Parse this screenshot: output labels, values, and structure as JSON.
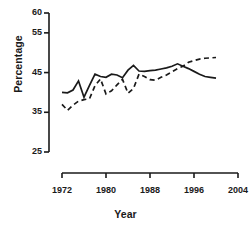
{
  "chart_data": {
    "type": "line",
    "title": "",
    "xlabel": "Year",
    "ylabel": "Percentage",
    "xlim": [
      1972,
      2004
    ],
    "ylim": [
      25,
      60
    ],
    "grid": false,
    "legend": "none",
    "xticks": [
      1972,
      1980,
      1988,
      1996,
      2004
    ],
    "yticks": [
      25,
      35,
      45,
      55,
      60
    ],
    "x": [
      1972,
      1973,
      1974,
      1975,
      1976,
      1977,
      1978,
      1979,
      1980,
      1981,
      1982,
      1983,
      1984,
      1985,
      1986,
      1987,
      1988,
      1989,
      1990,
      1991,
      1992,
      1993,
      1994,
      1995,
      1996,
      1997,
      1998,
      1999,
      2000
    ],
    "series": [
      {
        "name": "solid-series",
        "style": "solid",
        "color": "#1a1a1a",
        "values": [
          40.0,
          39.9,
          40.6,
          42.9,
          38.8,
          41.8,
          44.6,
          44.0,
          43.8,
          44.6,
          44.4,
          43.7,
          45.6,
          46.8,
          45.4,
          45.3,
          45.5,
          45.6,
          45.9,
          46.2,
          46.6,
          47.2,
          46.6,
          46.0,
          45.3,
          44.6,
          44.0,
          43.8,
          43.6
        ]
      },
      {
        "name": "dashed-series",
        "style": "dashed",
        "color": "#1a1a1a",
        "values": [
          37.0,
          35.5,
          36.8,
          37.8,
          38.2,
          38.4,
          41.7,
          43.4,
          39.6,
          40.4,
          41.9,
          43.3,
          39.8,
          41.0,
          44.6,
          44.0,
          43.2,
          43.1,
          43.8,
          44.4,
          45.2,
          46.0,
          46.6,
          47.6,
          48.0,
          48.4,
          48.6,
          48.7,
          48.8
        ]
      }
    ]
  }
}
